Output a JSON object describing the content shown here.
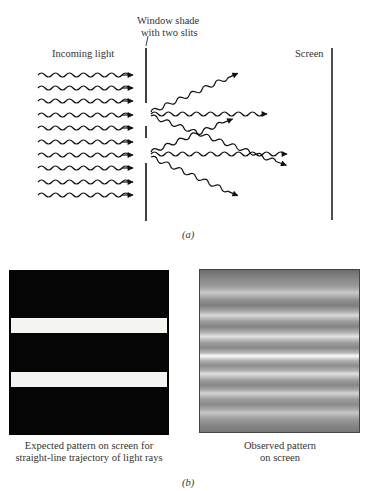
{
  "figure_a": {
    "label_incoming": "Incoming light",
    "label_shade_line1": "Window shade",
    "label_shade_line2": "with two slits",
    "label_screen": "Screen",
    "caption": "(a)",
    "incoming_wave_count": 10,
    "slit_count": 2,
    "diffracted_waves_per_slit": 3
  },
  "figure_b": {
    "expected": {
      "caption_line1": "Expected pattern on screen for",
      "caption_line2": "straight-line trajectory of light rays",
      "background": "#050505",
      "bar_color": "#f4f4f0",
      "bar_count": 2
    },
    "observed": {
      "caption_line1": "Observed pattern",
      "caption_line2": "on screen",
      "bright_fringe_count": 7
    },
    "caption": "(b)"
  }
}
